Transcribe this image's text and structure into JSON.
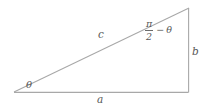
{
  "figure": {
    "type": "right-triangle-diagram",
    "background_color": "#ffffff",
    "line_color": "#a8a8a8",
    "text_color": "#575757",
    "width": 207,
    "height": 109
  },
  "vertices": {
    "left": {
      "x": 14,
      "y": 92
    },
    "top_right": {
      "x": 189,
      "y": 8
    },
    "bottom_right": {
      "x": 188,
      "y": 92
    }
  },
  "labels": {
    "angle_theta": "θ",
    "hypotenuse": "c",
    "base": "a",
    "vertical_side": "b",
    "complement_numerator": "π",
    "complement_denominator": "2",
    "complement_minus": "−",
    "complement_theta": "θ"
  },
  "sides": {
    "hypotenuse_label": "c",
    "adjacent_label": "a",
    "opposite_label": "b"
  },
  "angles": {
    "bottom_left": "θ",
    "top_right": "π/2 − θ",
    "bottom_right": "right angle"
  }
}
